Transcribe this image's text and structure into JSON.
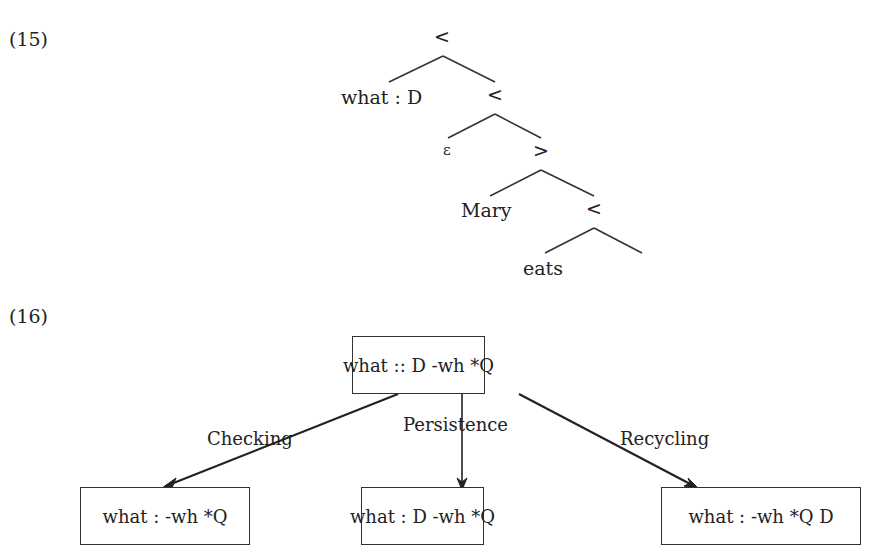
{
  "example15": {
    "number": "(15)",
    "tree": {
      "root": "<",
      "nodes": [
        {
          "label": "what : D"
        },
        {
          "label": "<"
        },
        {
          "label": "ε"
        },
        {
          "label": ">"
        },
        {
          "label": "Mary"
        },
        {
          "label": "<"
        },
        {
          "label": "eats"
        }
      ]
    }
  },
  "example16": {
    "number": "(16)",
    "top_box": "what :: D -wh *Q",
    "edges": [
      {
        "label": "Checking",
        "target": "what : -wh *Q"
      },
      {
        "label": "Persistence",
        "target": "what : D -wh *Q"
      },
      {
        "label": "Recycling",
        "target": "what : -wh *Q D"
      }
    ]
  }
}
